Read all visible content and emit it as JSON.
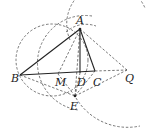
{
  "diagram": {
    "type": "geometry-figure",
    "points": {
      "A": {
        "label": "A",
        "x": 80,
        "y": 29
      },
      "B": {
        "label": "B",
        "x": 20,
        "y": 75
      },
      "M": {
        "label": "M",
        "x": 58,
        "y": 74
      },
      "D": {
        "label": "D",
        "x": 80,
        "y": 73
      },
      "C": {
        "label": "C",
        "x": 95,
        "y": 71
      },
      "Q": {
        "label": "Q",
        "x": 127,
        "y": 70
      },
      "E": {
        "label": "E",
        "x": 75,
        "y": 96
      }
    },
    "solid_segments": [
      "AB",
      "AC",
      "AD",
      "BC"
    ],
    "dashed_segments": [
      "AQ",
      "CQ",
      "EQ",
      "BE",
      "EC",
      "ED",
      "EM",
      "AE"
    ],
    "dashed_circles": [
      "circle-1",
      "circle-2",
      "circle-3"
    ]
  }
}
